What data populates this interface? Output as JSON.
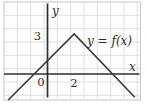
{
  "figure": {
    "labels": {
      "y_axis": "y",
      "x_axis": "x",
      "y_tick_3": "3",
      "origin": "0",
      "x_tick_2": "2",
      "curve": "y = f(x)"
    },
    "colors": {
      "axis": "#2e2e2e",
      "curve": "#3a3a3a",
      "grid": "#dadada",
      "frame": "#c6c6c6",
      "plot_background": "#fdfdfd",
      "text": "#2e2e2e"
    }
  },
  "chart_data": {
    "type": "line",
    "title": "",
    "curve_label": "y = f(x)",
    "function": "f(x) = 3 - |x - 2|",
    "series": [
      {
        "name": "f(x)",
        "points": [
          [
            -2.95,
            -1.95
          ],
          [
            2,
            3
          ],
          [
            6.55,
            -1.75
          ]
        ]
      }
    ],
    "key_points": {
      "peak": [
        2,
        3
      ],
      "x_intercepts": [
        -1,
        5
      ],
      "y_intercept_value": 1
    },
    "x_tick_labels": [
      "0",
      "2"
    ],
    "y_tick_labels": [
      "3"
    ],
    "xlabel": "x",
    "ylabel": "y",
    "grid": true,
    "xlim": [
      -3.3,
      7.0
    ],
    "ylim": [
      -2.6,
      5.4
    ]
  }
}
